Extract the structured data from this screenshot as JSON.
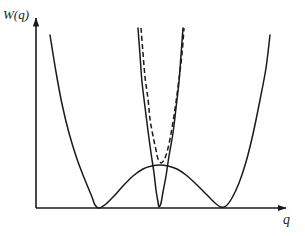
{
  "figure": {
    "title": "",
    "background_color": "#ffffff",
    "stroke_color": "#1a1a1a",
    "width": 305,
    "height": 236
  },
  "axes": {
    "y_label": "W(q)",
    "x_label": "q",
    "origin": {
      "x": 36,
      "y": 208
    },
    "y_axis_tip": {
      "x": 36,
      "y": 16
    },
    "x_axis_tip": {
      "x": 288,
      "y": 208
    },
    "arrowheads": true,
    "ticks": [],
    "grid": false
  },
  "chart_data": {
    "type": "line",
    "title": "W(q)",
    "xlabel": "q",
    "ylabel": "W(q)",
    "xlim": [
      0,
      1
    ],
    "ylim": [
      0,
      1
    ],
    "grid": false,
    "legend_position": "none",
    "annotations": [],
    "series": [
      {
        "name": "double-well-potential",
        "style": "solid",
        "color": "#1a1a1a",
        "description": "Symmetric double-well curve with two minima touching the q-axis and a central barrier maximum",
        "minima_x": [
          95,
          222
        ],
        "minima_y": [
          208,
          208
        ],
        "barrier_peak": {
          "x": 160,
          "y": 166
        },
        "points": [
          [
            50,
            35
          ],
          [
            56,
            72
          ],
          [
            62,
            104
          ],
          [
            69,
            133
          ],
          [
            77,
            159
          ],
          [
            85,
            180
          ],
          [
            92,
            197
          ],
          [
            95,
            205
          ],
          [
            99,
            208
          ],
          [
            106,
            204
          ],
          [
            114,
            196
          ],
          [
            123,
            186
          ],
          [
            133,
            176
          ],
          [
            143,
            169
          ],
          [
            152,
            166
          ],
          [
            160,
            165
          ],
          [
            168,
            166
          ],
          [
            177,
            169
          ],
          [
            186,
            175
          ],
          [
            196,
            184
          ],
          [
            206,
            194
          ],
          [
            215,
            203
          ],
          [
            221,
            207
          ],
          [
            226,
            206
          ],
          [
            232,
            198
          ],
          [
            239,
            183
          ],
          [
            246,
            162
          ],
          [
            253,
            134
          ],
          [
            260,
            100
          ],
          [
            266,
            68
          ],
          [
            270,
            35
          ]
        ]
      },
      {
        "name": "narrow-parabola-solid",
        "style": "solid",
        "color": "#1a1a1a",
        "description": "Steep narrow parabola with its minimum on the q-axis at the centre of the barrier",
        "vertex": {
          "x": 159,
          "y": 207
        },
        "points": [
          [
            138,
            28
          ],
          [
            140,
            55
          ],
          [
            142,
            82
          ],
          [
            145,
            107
          ],
          [
            148,
            131
          ],
          [
            151,
            153
          ],
          [
            154,
            173
          ],
          [
            156,
            190
          ],
          [
            158,
            202
          ],
          [
            159,
            207
          ],
          [
            161,
            203
          ],
          [
            163,
            192
          ],
          [
            166,
            176
          ],
          [
            169,
            156
          ],
          [
            173,
            133
          ],
          [
            176,
            108
          ],
          [
            179,
            82
          ],
          [
            181,
            55
          ],
          [
            183,
            28
          ]
        ]
      },
      {
        "name": "narrow-parabola-dashed",
        "style": "dashed",
        "color": "#1a1a1a",
        "description": "Dashed parabola of slightly smaller curvature whose minimum sits on the barrier top",
        "vertex": {
          "x": 161,
          "y": 163
        },
        "dash_pattern": "5 3",
        "points": [
          [
            141,
            28
          ],
          [
            143,
            53
          ],
          [
            145,
            77
          ],
          [
            148,
            99
          ],
          [
            150,
            119
          ],
          [
            153,
            136
          ],
          [
            156,
            150
          ],
          [
            158,
            159
          ],
          [
            161,
            163
          ],
          [
            164,
            160
          ],
          [
            167,
            152
          ],
          [
            170,
            139
          ],
          [
            173,
            122
          ],
          [
            176,
            102
          ],
          [
            179,
            79
          ],
          [
            182,
            54
          ],
          [
            184,
            28
          ]
        ]
      }
    ]
  }
}
